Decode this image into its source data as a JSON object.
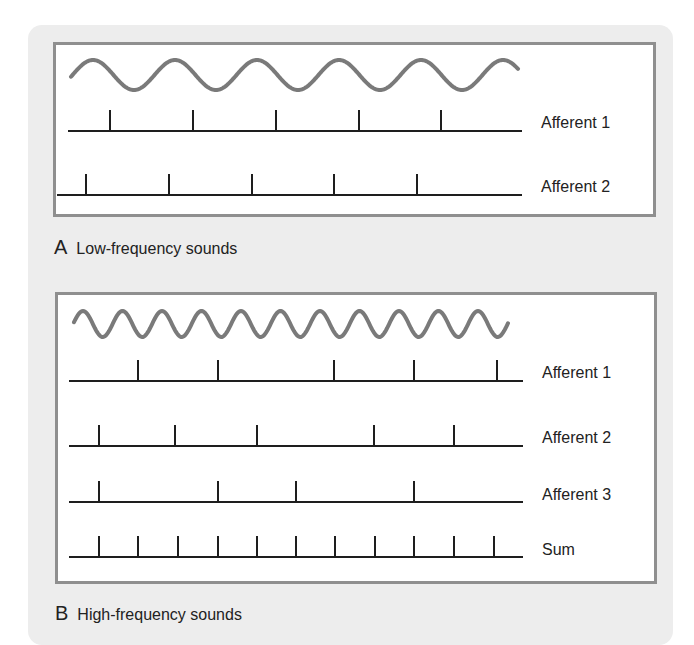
{
  "panels": [
    {
      "letter": "A",
      "title": "Low-frequency sounds",
      "wave": {
        "x_start": 71,
        "x_end": 518,
        "center_y": 75,
        "amplitude": 15,
        "period": 82,
        "phase_peak_x": 93
      },
      "traces": [
        {
          "label": "Afferent 1",
          "y": 131,
          "x_start": 68,
          "x_end": 522,
          "spikes": [
            110,
            193,
            276,
            359,
            441
          ]
        },
        {
          "label": "Afferent 2",
          "y": 195,
          "x_start": 57,
          "x_end": 522,
          "spikes": [
            86,
            169,
            252,
            334,
            417
          ]
        }
      ]
    },
    {
      "letter": "B",
      "title": "High-frequency sounds",
      "wave": {
        "x_start": 74,
        "x_end": 508,
        "center_y": 324,
        "amplitude": 13,
        "period": 39.5,
        "phase_peak_x": 83
      },
      "traces": [
        {
          "label": "Afferent 1",
          "y": 381,
          "x_start": 69,
          "x_end": 523,
          "spikes": [
            138,
            218,
            334,
            414,
            497
          ]
        },
        {
          "label": "Afferent 2",
          "y": 446,
          "x_start": 69,
          "x_end": 523,
          "spikes": [
            99,
            175,
            257,
            374,
            454
          ]
        },
        {
          "label": "Afferent 3",
          "y": 502,
          "x_start": 69,
          "x_end": 523,
          "spikes": [
            99,
            218,
            296,
            414
          ]
        },
        {
          "label": "Sum",
          "y": 557,
          "x_start": 69,
          "x_end": 523,
          "spikes": [
            99,
            138,
            178,
            218,
            257,
            296,
            335,
            375,
            414,
            454,
            494
          ]
        }
      ]
    }
  ],
  "colors": {
    "wave": "#7a7a7a",
    "trace": "#1e1e1e",
    "frame": "#8f8f8f",
    "card": "#ededed"
  },
  "spike_height": 21
}
